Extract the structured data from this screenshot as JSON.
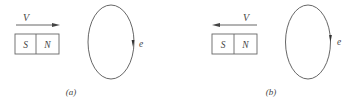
{
  "colors": {
    "stroke": "#555555",
    "text": "#444444",
    "background": "#ffffff"
  },
  "panels": [
    {
      "id": "a",
      "caption": "(a)",
      "velocity_label": "V",
      "velocity_direction": "right",
      "magnet": {
        "left_pole": "S",
        "right_pole": "N"
      },
      "loop": {
        "emf_label": "e",
        "arrow_direction": "down-on-right-side"
      }
    },
    {
      "id": "b",
      "caption": "(b)",
      "velocity_label": "V",
      "velocity_direction": "left",
      "magnet": {
        "left_pole": "S",
        "right_pole": "N"
      },
      "loop": {
        "emf_label": "e",
        "arrow_direction": "down-on-right-side"
      }
    }
  ]
}
